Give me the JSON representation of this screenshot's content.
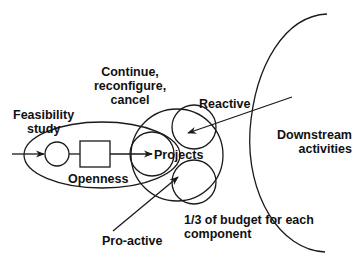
{
  "diagram": {
    "labels": {
      "continue": [
        "Continue,",
        "reconfigure,",
        "cancel"
      ],
      "feasibility": [
        "Feasibility",
        "study"
      ],
      "openness": "Openness",
      "projects": "Projects",
      "reactive": "Reactive",
      "proactive": "Pro-active",
      "downstream": [
        "Downstream",
        "activities"
      ],
      "budget": [
        "1/3 of budget for each",
        "component"
      ]
    },
    "colors": {
      "stroke": "#1a1a1a",
      "text": "#111111",
      "background": "#ffffff"
    }
  }
}
